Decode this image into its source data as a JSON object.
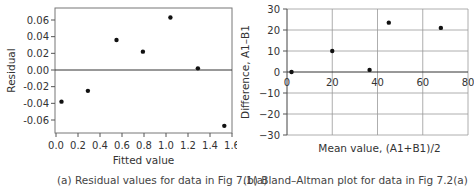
{
  "chart_data": [
    {
      "type": "scatter",
      "title": "",
      "caption": "(a) Residual values for data in Fig 7.1(a)",
      "xlabel": "Fitted value",
      "ylabel": "Residual",
      "xlim": [
        0.0,
        1.6
      ],
      "ylim": [
        -0.07,
        0.07
      ],
      "xticks": [
        "0.0",
        "0.2",
        "0.4",
        "0.6",
        "0.8",
        "1.0",
        "1.2",
        "1.4",
        "1.6"
      ],
      "yticks": [
        "0.06",
        "0.04",
        "0.02",
        "0.00",
        "-0.02",
        "-0.04",
        "-0.06"
      ],
      "grid": false,
      "reference_line_y": 0.0,
      "points": [
        {
          "x": 0.05,
          "y": -0.038
        },
        {
          "x": 0.29,
          "y": -0.025
        },
        {
          "x": 0.55,
          "y": 0.036
        },
        {
          "x": 0.79,
          "y": 0.022
        },
        {
          "x": 1.04,
          "y": 0.063
        },
        {
          "x": 1.29,
          "y": 0.002
        },
        {
          "x": 1.53,
          "y": -0.067
        }
      ]
    },
    {
      "type": "scatter",
      "title": "",
      "caption": "(b) Bland–Altman plot for data in Fig 7.2(a)",
      "xlabel": "Mean value, (A1+B1)/2",
      "ylabel": "Difference, A1–B1",
      "xlim": [
        0,
        80
      ],
      "ylim": [
        -30,
        30
      ],
      "xticks": [
        "0",
        "20",
        "40",
        "60",
        "80"
      ],
      "yticks": [
        "30",
        "20",
        "10",
        "0",
        "−10",
        "−20",
        "−30"
      ],
      "grid": true,
      "points": [
        {
          "x": 2,
          "y": 0
        },
        {
          "x": 20,
          "y": 10
        },
        {
          "x": 36.5,
          "y": 1
        },
        {
          "x": 45,
          "y": 23.5
        },
        {
          "x": 68,
          "y": 21
        }
      ]
    }
  ]
}
